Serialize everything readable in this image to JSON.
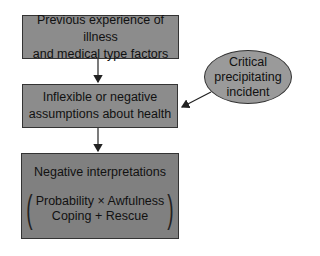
{
  "colors": {
    "box_fill": "#8c8c8c",
    "box3_fill": "#808080",
    "ellipse_fill": "#9a9a9a",
    "border": "#333333"
  },
  "boxes": [
    {
      "lines": [
        "Previous experience of illness",
        "and medical type factors"
      ]
    },
    {
      "lines": [
        "Inflexible or negative",
        "assumptions about health"
      ]
    },
    {
      "title": "Negative interpretations",
      "numerator": "Probability × Awfulness",
      "denominator": "Coping + Rescue",
      "paren_left": "(",
      "paren_right": ")"
    }
  ],
  "ellipse": {
    "lines": [
      "Critical",
      "precipitating",
      "incident"
    ]
  }
}
